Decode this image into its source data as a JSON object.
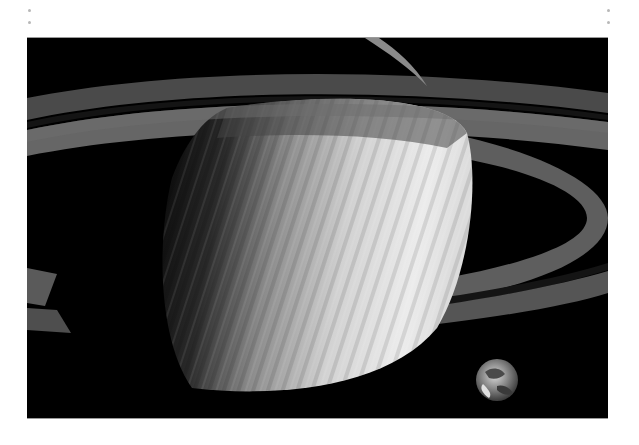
{
  "image": {
    "alt": "Saturn with its rings and Earth shown to scale, grayscale",
    "subjects": [
      "Saturn",
      "Saturn rings",
      "Earth"
    ],
    "palette": {
      "space": "#000000",
      "planet_light": "#e6e6e6",
      "planet_shadow": "#1a1a1a",
      "ring_outer": "#5a5a5a",
      "ring_inner": "#6e6e6e",
      "ring_gap": "#151515",
      "page_bg": "#ffffff",
      "margin_dot": "#b8b8b8"
    }
  },
  "page": {
    "margin_dots": 4
  }
}
